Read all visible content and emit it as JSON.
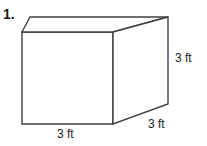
{
  "problem": {
    "number": "1."
  },
  "figure": {
    "shape_name": "rectangular-prism",
    "stroke_color": "#404040",
    "fill_color": "#ffffff",
    "background_color": "#ffffff",
    "vertices": {
      "front_top_left": [
        22,
        32
      ],
      "front_top_right": [
        113,
        32
      ],
      "front_bottom_right": [
        113,
        124
      ],
      "front_bottom_left": [
        22,
        124
      ],
      "back_top_left": [
        30,
        17
      ],
      "back_top_right": [
        168,
        17
      ],
      "back_bottom_right": [
        168,
        104
      ]
    }
  },
  "labels": {
    "height": "3 ft",
    "depth": "3 ft",
    "width": "3 ft"
  }
}
